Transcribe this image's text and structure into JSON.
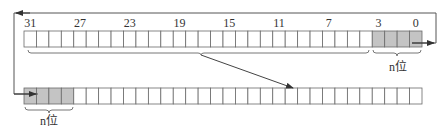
{
  "diagram": {
    "type": "rotate-right-by-n-bits",
    "colors": {
      "stroke": "#6a6a6a",
      "shaded": "#c4c4c4",
      "empty": "#ffffff",
      "text": "#333333"
    },
    "top_register": {
      "bits": 32,
      "bit_labels": [
        {
          "text": "31",
          "bit": 31
        },
        {
          "text": "27",
          "bit": 27
        },
        {
          "text": "23",
          "bit": 23
        },
        {
          "text": "19",
          "bit": 19
        },
        {
          "text": "15",
          "bit": 15
        },
        {
          "text": "11",
          "bit": 11
        },
        {
          "text": "7",
          "bit": 7
        },
        {
          "text": "3",
          "bit": 3
        },
        {
          "text": "0",
          "bit": 0
        }
      ],
      "shaded_bits": [
        3,
        2,
        1,
        0
      ],
      "brace_label": "n位"
    },
    "bottom_register": {
      "bits": 32,
      "shaded_positions": [
        0,
        1,
        2,
        3
      ],
      "brace_label": "n位"
    }
  }
}
